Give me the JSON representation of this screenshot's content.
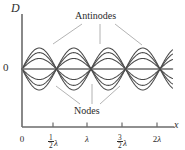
{
  "figure": {
    "kind": "standing-wave-diagram",
    "background_color": "#ffffff",
    "curve_color": "#4a4a4a",
    "axis_color": "#6b6b6b",
    "text_color": "#2e2e2e",
    "leader_color": "#9a9a9a"
  },
  "axes": {
    "y_label": "D",
    "x_label": "x",
    "origin_label": "0",
    "x_axis_y_px": 127,
    "y_axis_x_px": 22,
    "baseline_y_px": 69,
    "x_ticks": [
      {
        "label_whole": "0",
        "numerator": "",
        "denominator": "",
        "symbol": "",
        "x_px": 22
      },
      {
        "label_whole": "",
        "numerator": "1",
        "denominator": "2",
        "symbol": "λ",
        "x_px": 53
      },
      {
        "label_whole": "",
        "numerator": "",
        "denominator": "",
        "symbol": "λ",
        "x_px": 87
      },
      {
        "label_whole": "",
        "numerator": "3",
        "denominator": "2",
        "symbol": "λ",
        "x_px": 122
      },
      {
        "label_whole": "2",
        "numerator": "",
        "denominator": "",
        "symbol": "λ",
        "x_px": 157
      }
    ]
  },
  "annotations": {
    "antinodes": {
      "text": "Antinodes",
      "x_px": 75,
      "y_px": 11,
      "leaders": [
        {
          "x1": 82,
          "y1": 24,
          "x2": 53,
          "y2": 44
        },
        {
          "x1": 100,
          "y1": 24,
          "x2": 100,
          "y2": 44
        },
        {
          "x1": 115,
          "y1": 24,
          "x2": 142,
          "y2": 45
        }
      ]
    },
    "nodes": {
      "text": "Nodes",
      "x_px": 74,
      "y_px": 106,
      "leaders": [
        {
          "x1": 80,
          "y1": 104,
          "x2": 56,
          "y2": 86
        },
        {
          "x1": 92,
          "y1": 104,
          "x2": 92,
          "y2": 84
        },
        {
          "x1": 100,
          "y1": 104,
          "x2": 120,
          "y2": 86
        }
      ]
    }
  },
  "chart_data": {
    "type": "line",
    "title": "",
    "xlabel": "x",
    "ylabel": "D",
    "x_range_wavelengths": [
      0,
      2.18
    ],
    "node_positions_wavelengths": [
      0,
      0.5,
      1.0,
      1.5,
      2.0
    ],
    "antinode_positions_wavelengths": [
      0.25,
      0.75,
      1.25,
      1.75
    ],
    "wavelength_px": 69,
    "x_start_px": 22,
    "amplitude_max_px": 21,
    "series": [
      {
        "name": "snapshot-1-positive-max",
        "amplitude_fraction": 1.0
      },
      {
        "name": "snapshot-2-positive-mid",
        "amplitude_fraction": 0.78
      },
      {
        "name": "snapshot-3-positive-low",
        "amplitude_fraction": 0.5
      },
      {
        "name": "snapshot-4-zero",
        "amplitude_fraction": 0.0
      },
      {
        "name": "snapshot-5-negative-low",
        "amplitude_fraction": -0.5
      },
      {
        "name": "snapshot-6-negative-mid",
        "amplitude_fraction": -0.78
      },
      {
        "name": "snapshot-7-negative-max",
        "amplitude_fraction": -1.0
      }
    ],
    "legend": false,
    "grid": false
  }
}
